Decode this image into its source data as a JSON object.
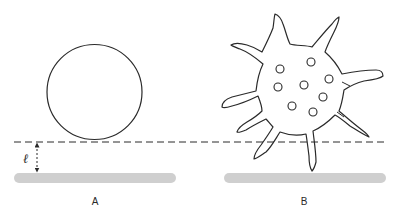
{
  "figure": {
    "colors": {
      "outline": "#2a2a2a",
      "substrate": "#cfcfcf",
      "background": "#ffffff"
    },
    "dashed_line": {
      "y": 142,
      "x_start": 14,
      "x_end": 386,
      "dash": "7 4"
    },
    "distance_marker": {
      "label": "ℓ",
      "x": 37,
      "y_top": 143,
      "y_bottom": 172
    },
    "panels": [
      {
        "id": "A",
        "label": "A",
        "label_pos": {
          "x": 95,
          "y": 205
        },
        "cell": {
          "shape": "circle",
          "cx": 94.5,
          "cy": 92,
          "r": 47.5
        },
        "substrate": {
          "x": 14,
          "y": 173,
          "width": 162,
          "height": 10
        }
      },
      {
        "id": "B",
        "label": "B",
        "label_pos": {
          "x": 304,
          "y": 205
        },
        "cell": {
          "shape": "spiky-blob-with-filopodia"
        },
        "vesicles": [
          {
            "cx": 280,
            "cy": 69,
            "r": 4
          },
          {
            "cx": 311,
            "cy": 62,
            "r": 4
          },
          {
            "cx": 329,
            "cy": 79,
            "r": 4
          },
          {
            "cx": 278,
            "cy": 87,
            "r": 4
          },
          {
            "cx": 304,
            "cy": 85,
            "r": 4
          },
          {
            "cx": 323,
            "cy": 97,
            "r": 4
          },
          {
            "cx": 292,
            "cy": 106,
            "r": 4
          },
          {
            "cx": 313,
            "cy": 112,
            "r": 4
          }
        ],
        "substrate": {
          "x": 224,
          "y": 173,
          "width": 162,
          "height": 10
        }
      }
    ]
  }
}
